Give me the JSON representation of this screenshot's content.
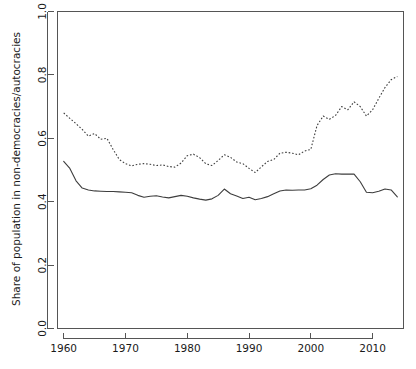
{
  "chart_data": {
    "type": "line",
    "title": "",
    "xlabel": "",
    "ylabel": "Share of population in non-democracies/autocracies",
    "xlim": [
      1959,
      2015
    ],
    "ylim": [
      0.0,
      1.0
    ],
    "grid": false,
    "legend": "none",
    "xticks": [
      1960,
      1970,
      1980,
      1990,
      2000,
      2010
    ],
    "xtick_labels": [
      "1960",
      "1970",
      "1980",
      "1990",
      "2000",
      "2010"
    ],
    "yticks": [
      0.0,
      0.2,
      0.4,
      0.6,
      0.8,
      1.0
    ],
    "ytick_labels": [
      "0.0",
      "0.2",
      "0.4",
      "0.6",
      "0.8",
      "1.0"
    ],
    "series": [
      {
        "name": "solid-series",
        "style": "solid",
        "color": "#3d3d3d",
        "x": [
          1960,
          1961,
          1962,
          1963,
          1964,
          1965,
          1966,
          1967,
          1968,
          1969,
          1970,
          1971,
          1972,
          1973,
          1974,
          1975,
          1976,
          1977,
          1978,
          1979,
          1980,
          1981,
          1982,
          1983,
          1984,
          1985,
          1986,
          1987,
          1988,
          1989,
          1990,
          1991,
          1992,
          1993,
          1994,
          1995,
          1996,
          1997,
          1998,
          1999,
          2000,
          2001,
          2002,
          2003,
          2004,
          2005,
          2006,
          2007,
          2008,
          2009,
          2010,
          2011,
          2012,
          2013,
          2014
        ],
        "values": [
          0.527,
          0.505,
          0.466,
          0.443,
          0.437,
          0.434,
          0.433,
          0.432,
          0.432,
          0.431,
          0.43,
          0.428,
          0.42,
          0.414,
          0.417,
          0.419,
          0.415,
          0.412,
          0.416,
          0.42,
          0.417,
          0.412,
          0.408,
          0.405,
          0.409,
          0.42,
          0.44,
          0.425,
          0.418,
          0.41,
          0.414,
          0.406,
          0.41,
          0.416,
          0.425,
          0.434,
          0.437,
          0.436,
          0.437,
          0.437,
          0.441,
          0.452,
          0.47,
          0.484,
          0.488,
          0.487,
          0.487,
          0.487,
          0.463,
          0.43,
          0.428,
          0.433,
          0.44,
          0.437,
          0.415
        ]
      },
      {
        "name": "dotted-series",
        "style": "dotted",
        "color": "#3d3d3d",
        "x": [
          1960,
          1961,
          1962,
          1963,
          1964,
          1965,
          1966,
          1967,
          1968,
          1969,
          1970,
          1971,
          1972,
          1973,
          1974,
          1975,
          1976,
          1977,
          1978,
          1979,
          1980,
          1981,
          1982,
          1983,
          1984,
          1985,
          1986,
          1987,
          1988,
          1989,
          1990,
          1991,
          1992,
          1993,
          1994,
          1995,
          1996,
          1997,
          1998,
          1999,
          2000,
          2001,
          2002,
          2003,
          2004,
          2005,
          2006,
          2007,
          2008,
          2009,
          2010,
          2011,
          2012,
          2013,
          2014
        ],
        "values": [
          0.68,
          0.663,
          0.646,
          0.628,
          0.607,
          0.615,
          0.597,
          0.6,
          0.565,
          0.533,
          0.52,
          0.513,
          0.518,
          0.52,
          0.518,
          0.514,
          0.516,
          0.511,
          0.509,
          0.522,
          0.545,
          0.55,
          0.539,
          0.52,
          0.514,
          0.53,
          0.548,
          0.54,
          0.525,
          0.52,
          0.505,
          0.492,
          0.51,
          0.527,
          0.533,
          0.553,
          0.556,
          0.553,
          0.548,
          0.56,
          0.565,
          0.64,
          0.67,
          0.66,
          0.672,
          0.7,
          0.69,
          0.715,
          0.7,
          0.67,
          0.69,
          0.726,
          0.76,
          0.785,
          0.795
        ]
      }
    ]
  }
}
